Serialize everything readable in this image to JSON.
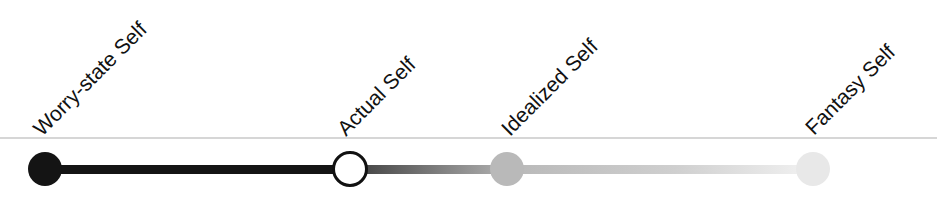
{
  "diagram": {
    "type": "spectrum",
    "orientation": "horizontal",
    "nodes": [
      {
        "label": "Worry-state Self",
        "x": 45,
        "fill": "#141414",
        "stroke": "#141414",
        "style": "filled"
      },
      {
        "label": "Actual Self",
        "x": 350,
        "fill": "#ffffff",
        "stroke": "#111111",
        "style": "outline"
      },
      {
        "label": "Idealized Self",
        "x": 507,
        "fill": "#b9b9b9",
        "stroke": "#b9b9b9",
        "style": "filled"
      },
      {
        "label": "Fantasy Self",
        "x": 813,
        "fill": "#e8e8e8",
        "stroke": "#e8e8e8",
        "style": "filled"
      }
    ],
    "segments": [
      {
        "from": "Worry-state Self",
        "to": "Actual Self",
        "color_start": "#141414",
        "color_end": "#141414"
      },
      {
        "from": "Actual Self",
        "to": "Idealized Self",
        "color_start": "#4a4a4a",
        "color_end": "#b0b0b0"
      },
      {
        "from": "Idealized Self",
        "to": "Fantasy Self",
        "color_start": "#b8b8b8",
        "color_end": "#f2f2f2"
      }
    ],
    "rule_color": "#d6d6d6"
  }
}
